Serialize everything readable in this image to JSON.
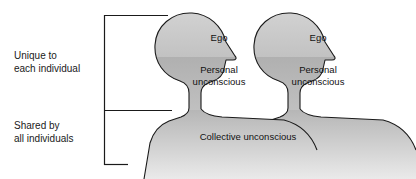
{
  "diagram": {
    "bracket_labels": {
      "upper": "Unique to\neach individual",
      "lower": "Shared by\nall individuals"
    },
    "figures": [
      {
        "id": "person-left",
        "ego_label": "Ego",
        "personal_unconscious_label": "Personal\nunconscious"
      },
      {
        "id": "person-right",
        "ego_label": "Ego",
        "personal_unconscious_label": "Personal\nunconscious"
      }
    ],
    "shared_region_label": "Collective unconscious",
    "colors": {
      "ego_fill": "#c9c9c9",
      "personal_unconscious_fill": "#b4b4b4",
      "collective_top": "#bdbdbd",
      "collective_bottom": "#e2e2e2",
      "outline": "#1a1a1a",
      "text": "#111111",
      "background": "#ffffff"
    }
  }
}
